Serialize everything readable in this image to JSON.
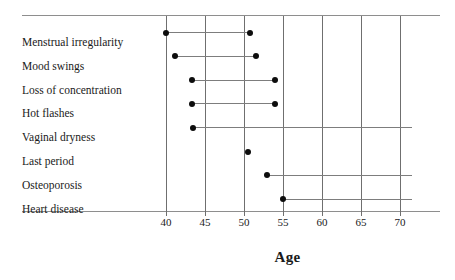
{
  "chart_data": {
    "type": "range_dot_plot",
    "title": "",
    "xlabel": "Age",
    "ylabel": "",
    "xlim": [
      38.5,
      72
    ],
    "xticks": [
      40,
      45,
      50,
      55,
      60,
      65,
      70
    ],
    "xtick_labels": [
      "40",
      "45",
      "50",
      "55",
      "60",
      "65",
      "70"
    ],
    "grid": true,
    "grid_axis": "x",
    "legend": "none",
    "categories": [
      "Menstrual irregularity",
      "Mood swings",
      "Loss of concentration",
      "Hot flashes",
      "Vaginal dryness",
      "Last period",
      "Osteoporosis",
      "Heart disease"
    ],
    "marker": "filled-circle",
    "marker_color": "#0d0d0d",
    "line_color": "#7d7d7d",
    "frame_color": "#8e8e8e",
    "ranges": [
      {
        "label": "Menstrual irregularity",
        "start": 40.0,
        "end": 50.8,
        "open_ended": false
      },
      {
        "label": "Mood swings",
        "start": 41.2,
        "end": 51.6,
        "open_ended": false
      },
      {
        "label": "Loss of concentration",
        "start": 43.3,
        "end": 54.0,
        "open_ended": false
      },
      {
        "label": "Hot flashes",
        "start": 43.3,
        "end": 54.0,
        "open_ended": false
      },
      {
        "label": "Vaginal dryness",
        "start": 43.4,
        "end": 71.5,
        "open_ended": true
      },
      {
        "label": "Last period",
        "start": 50.5,
        "end": 50.5,
        "open_ended": false
      },
      {
        "label": "Osteoporosis",
        "start": 53.0,
        "end": 71.5,
        "open_ended": true
      },
      {
        "label": "Heart disease",
        "start": 55.0,
        "end": 71.5,
        "open_ended": true
      }
    ]
  },
  "axis": {
    "title": "Age"
  }
}
